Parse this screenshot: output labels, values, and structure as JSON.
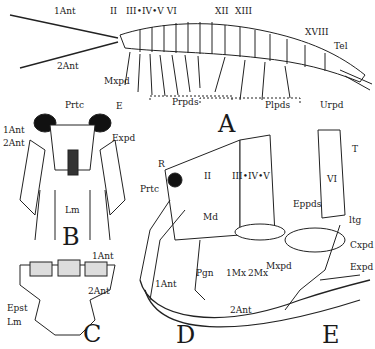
{
  "figure": {
    "panels": [
      {
        "id": "A",
        "letter": "A",
        "description": "Whole amphipod, lateral view"
      },
      {
        "id": "B",
        "letter": "B",
        "description": "Head, ventral view"
      },
      {
        "id": "C",
        "letter": "C",
        "description": "Head appendage bases, ventral"
      },
      {
        "id": "D",
        "letter": "D",
        "description": "Head and anterior thorax, lateral"
      },
      {
        "id": "E",
        "letter": "E",
        "description": "Thoracic segment VI with leg"
      }
    ],
    "labels": {
      "a_1ant": "1Ant",
      "a_2ant": "2Ant",
      "a_II": "II",
      "a_III_IV_V_VI": "III•IV•V VI",
      "a_XII": "XII",
      "a_XIII": "XIII",
      "a_XVIII": "XVIII",
      "a_tel": "Tel",
      "a_mxpd": "Mxpd",
      "a_prpds": "Prpds",
      "a_plpds": "Plpds",
      "a_urpd": "Urpd",
      "b_prtc": "Prtc",
      "b_e": "E",
      "b_1ant": "1Ant",
      "b_2ant": "2Ant",
      "b_expd": "Expd",
      "b_lm": "Lm",
      "c_1ant": "1Ant",
      "c_2ant": "2Ant",
      "c_epst": "Epst",
      "c_lm": "Lm",
      "d_r": "R",
      "d_prtc": "Prtc",
      "d_II": "II",
      "d_III_IV_V": "III•IV•V",
      "d_md": "Md",
      "d_mxpd": "Mxpd",
      "d_pgn": "Pgn",
      "d_1mx": "1Mx",
      "d_2mx": "2Mx",
      "d_1ant": "1Ant",
      "d_2ant": "2Ant",
      "e_vi": "VI",
      "e_t": "T",
      "e_eppds": "Eppds",
      "e_ltg": "ltg",
      "e_cxpd": "Cxpd",
      "e_expd": "Expd"
    }
  }
}
